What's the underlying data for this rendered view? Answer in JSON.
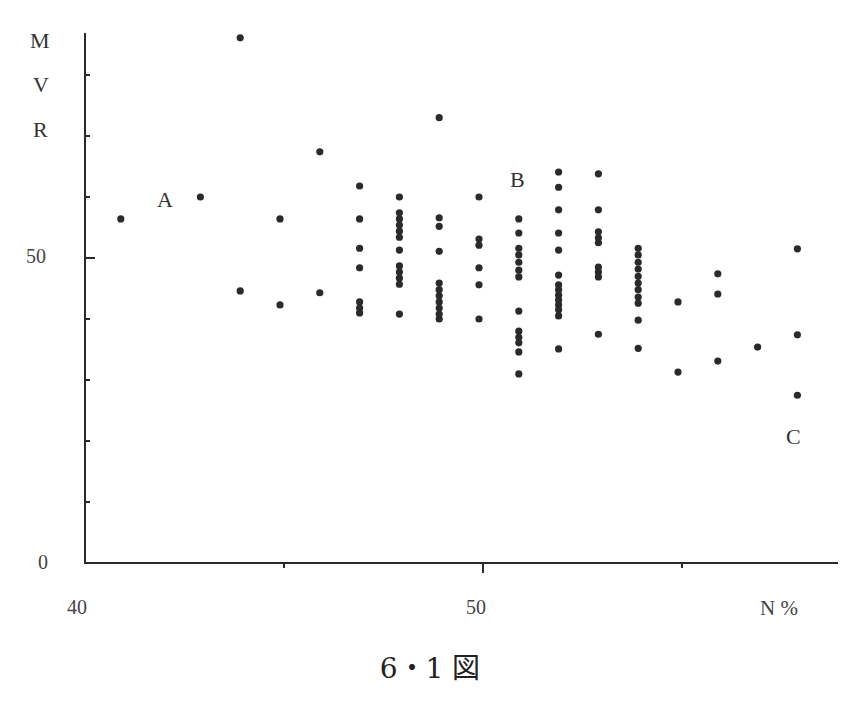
{
  "chart_data": {
    "type": "scatter",
    "title": "",
    "caption": "6・1 図",
    "xlabel": "N %",
    "ylabel": "MVR",
    "ylabel_chars": [
      "M",
      "V",
      "R"
    ],
    "xlim": [
      40,
      59
    ],
    "ylim": [
      0,
      87
    ],
    "x_ticks": [
      40,
      45,
      50,
      55
    ],
    "x_tick_labels": [
      {
        "value": 40,
        "label": "40"
      },
      {
        "value": 50,
        "label": "50"
      }
    ],
    "y_ticks": [
      0,
      10,
      20,
      30,
      40,
      50,
      60,
      70,
      80
    ],
    "y_tick_labels": [
      {
        "value": 0,
        "label": "0"
      },
      {
        "value": 50,
        "label": "50"
      }
    ],
    "grid": false,
    "annotations": [
      {
        "text": "A",
        "x": 42.1,
        "y": 59.5
      },
      {
        "text": "B",
        "x": 50.9,
        "y": 62.8
      },
      {
        "text": "C",
        "x": 57.9,
        "y": 20.8
      }
    ],
    "points": [
      [
        41,
        56.4
      ],
      [
        43,
        60.0
      ],
      [
        44,
        86.1
      ],
      [
        44,
        44.6
      ],
      [
        45,
        56.4
      ],
      [
        45,
        42.3
      ],
      [
        46,
        67.4
      ],
      [
        46,
        44.3
      ],
      [
        47,
        61.8
      ],
      [
        47,
        56.4
      ],
      [
        47,
        51.6
      ],
      [
        47,
        48.4
      ],
      [
        47,
        42.8
      ],
      [
        47,
        41.8
      ],
      [
        47,
        41.0
      ],
      [
        48,
        60.0
      ],
      [
        48,
        57.4
      ],
      [
        48,
        56.4
      ],
      [
        48,
        55.4
      ],
      [
        48,
        54.4
      ],
      [
        48,
        53.4
      ],
      [
        48,
        51.3
      ],
      [
        48,
        48.7
      ],
      [
        48,
        47.7
      ],
      [
        48,
        46.7
      ],
      [
        48,
        45.7
      ],
      [
        48,
        40.8
      ],
      [
        49,
        73.0
      ],
      [
        49,
        56.6
      ],
      [
        49,
        55.2
      ],
      [
        49,
        51.1
      ],
      [
        49,
        45.9
      ],
      [
        49,
        44.8
      ],
      [
        49,
        43.8
      ],
      [
        49,
        42.8
      ],
      [
        49,
        41.8
      ],
      [
        49,
        40.8
      ],
      [
        49,
        40.0
      ],
      [
        50,
        60.0
      ],
      [
        50,
        53.1
      ],
      [
        50,
        52.1
      ],
      [
        50,
        48.4
      ],
      [
        50,
        45.6
      ],
      [
        50,
        40.0
      ],
      [
        51,
        56.4
      ],
      [
        51,
        54.1
      ],
      [
        51,
        51.6
      ],
      [
        51,
        50.5
      ],
      [
        51,
        49.3
      ],
      [
        51,
        48.0
      ],
      [
        51,
        46.9
      ],
      [
        51,
        41.3
      ],
      [
        51,
        38.0
      ],
      [
        51,
        37.0
      ],
      [
        51,
        36.1
      ],
      [
        51,
        34.6
      ],
      [
        51,
        31.0
      ],
      [
        52,
        64.1
      ],
      [
        52,
        61.6
      ],
      [
        52,
        57.9
      ],
      [
        52,
        54.1
      ],
      [
        52,
        51.3
      ],
      [
        52,
        47.2
      ],
      [
        52,
        45.6
      ],
      [
        52,
        44.8
      ],
      [
        52,
        43.9
      ],
      [
        52,
        43.1
      ],
      [
        52,
        42.3
      ],
      [
        52,
        41.5
      ],
      [
        52,
        40.5
      ],
      [
        52,
        35.1
      ],
      [
        53,
        63.8
      ],
      [
        53,
        57.9
      ],
      [
        53,
        54.3
      ],
      [
        53,
        53.3
      ],
      [
        53,
        52.5
      ],
      [
        53,
        48.5
      ],
      [
        53,
        47.7
      ],
      [
        53,
        46.9
      ],
      [
        53,
        37.5
      ],
      [
        54,
        51.6
      ],
      [
        54,
        50.5
      ],
      [
        54,
        49.3
      ],
      [
        54,
        48.2
      ],
      [
        54,
        47.0
      ],
      [
        54,
        45.9
      ],
      [
        54,
        44.8
      ],
      [
        54,
        43.6
      ],
      [
        54,
        42.6
      ],
      [
        54,
        39.8
      ],
      [
        54,
        35.2
      ],
      [
        55,
        42.8
      ],
      [
        55,
        31.3
      ],
      [
        56,
        47.4
      ],
      [
        56,
        44.1
      ],
      [
        56,
        33.1
      ],
      [
        57,
        35.4
      ],
      [
        58,
        51.5
      ],
      [
        58,
        37.4
      ],
      [
        58,
        27.5
      ]
    ]
  },
  "labels": {
    "y_axis_M": "M",
    "y_axis_V": "V",
    "y_axis_R": "R",
    "y_tick_50": "50",
    "y_tick_0": "0",
    "x_tick_40": "40",
    "x_tick_50": "50",
    "x_axis_title": "N %",
    "annotation_A": "A",
    "annotation_B": "B",
    "annotation_C": "C",
    "caption": "6・1 図"
  },
  "colors": {
    "ink": "#2a2a2a",
    "background": "#ffffff"
  }
}
